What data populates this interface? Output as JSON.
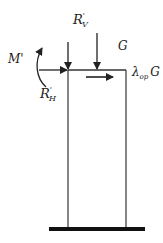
{
  "diagram": {
    "type": "structural-column-load-diagram",
    "labels": {
      "vertical_reaction": "R",
      "vertical_reaction_prime": "'",
      "vertical_reaction_sub": "V",
      "horizontal_reaction": "R",
      "horizontal_reaction_prime": "'",
      "horizontal_reaction_sub": "H",
      "moment": "M'",
      "self_weight": "G",
      "lateral_load_coef": "λ",
      "lateral_load_sub": "op",
      "lateral_load_var": "G"
    },
    "colors": {
      "line": "#222222",
      "base": "#111111",
      "background": "#ffffff"
    }
  }
}
